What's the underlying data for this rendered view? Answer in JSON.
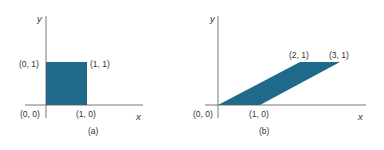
{
  "colors": {
    "fill": "#1f6a8a",
    "axis": "#555555",
    "text": "#333333"
  },
  "panel_a": {
    "caption": "(a)",
    "axis_x": "x",
    "axis_y": "y",
    "shape": "unit square",
    "labels": {
      "p00": "(0, 0)",
      "p10": "(1, 0)",
      "p01": "(0, 1)",
      "p11": "(1, 1)"
    }
  },
  "panel_b": {
    "caption": "(b)",
    "axis_x": "x",
    "axis_y": "y",
    "shape": "sheared parallelogram",
    "labels": {
      "p00": "(0, 0)",
      "p10": "(1, 0)",
      "p21": "(2, 1)",
      "p31": "(3, 1)"
    }
  }
}
